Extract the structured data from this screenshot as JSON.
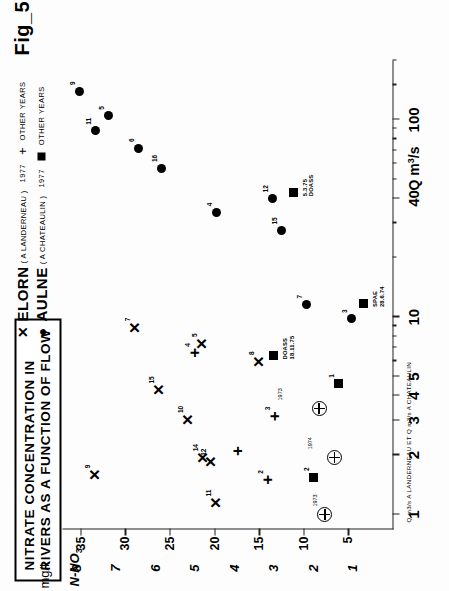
{
  "figure": {
    "number": "Fig_5",
    "title_line1": "NITRATE  CONCENTRATION  IN",
    "title_line2": "RIVERS  AS  A  FUNCTION  OF  FLOW"
  },
  "legend": {
    "entries": [
      {
        "marker": "x-marker",
        "name": "ELORN",
        "station": "( A  LANDERNEAU )",
        "year": "1977",
        "other_marker": "plus-marker",
        "other_label": "OTHER  YEARS"
      },
      {
        "marker": "dot-marker",
        "name": "AULNE",
        "station": "( A  CHATEAULIN )",
        "year": "1977",
        "other_marker": "square-marker",
        "other_label": "OTHER  YEARS"
      }
    ]
  },
  "axes": {
    "x": {
      "caption": "Q m",
      "caption_sup": "3",
      "caption_tail": "/s",
      "sub_caption": "Q m3/s  A  LANDERNEAU   ET   Q m3/s  A  CHATEAULIN",
      "scale": "log",
      "range": [
        0.85,
        200
      ],
      "ticks": [
        1,
        2,
        3,
        4,
        5,
        10,
        40,
        100
      ],
      "tick_labels": [
        "1",
        "2",
        "3",
        "4",
        "5",
        "10",
        "40",
        "100"
      ],
      "minor_ticks": [
        6,
        7,
        8,
        9,
        20,
        30,
        50,
        60,
        70,
        80,
        90,
        150,
        200
      ]
    },
    "y_primary": {
      "caption": "mg/l",
      "unit_label": "N-NO",
      "unit_sub": "3",
      "range": [
        0,
        37
      ],
      "ticks": [
        5,
        10,
        15,
        20,
        25,
        30,
        35
      ],
      "tick_labels": [
        "5",
        "10",
        "15",
        "20",
        "25",
        "30",
        "35"
      ]
    },
    "y_secondary": {
      "range": [
        0,
        8.35
      ],
      "ticks": [
        1,
        2,
        3,
        4,
        5,
        6,
        7,
        8
      ],
      "tick_labels": [
        "1",
        "2",
        "3",
        "4",
        "5",
        "6",
        "7",
        "8"
      ]
    }
  },
  "chart_data": {
    "type": "scatter",
    "title": "NITRATE CONCENTRATION IN RIVERS AS A FUNCTION OF FLOW",
    "xlabel": "Q m3/s",
    "ylabel": "N-NO3 mg/l",
    "xscale": "log",
    "xlim": [
      0.85,
      200
    ],
    "ylim": [
      0,
      37
    ],
    "grid": false,
    "legend_position": "top",
    "series": [
      {
        "name": "ELORN ( A LANDERNEAU ) 1977",
        "marker": "x",
        "points": [
          {
            "x": 1.15,
            "y": 19.8,
            "label": "11"
          },
          {
            "x": 1.95,
            "y": 21.3,
            "label": "14"
          },
          {
            "x": 1.85,
            "y": 20.4,
            "label": "12"
          },
          {
            "x": 3.05,
            "y": 23.0,
            "label": "10"
          },
          {
            "x": 4.3,
            "y": 26.2,
            "label": "15"
          },
          {
            "x": 6.0,
            "y": 15.0,
            "label": "8"
          },
          {
            "x": 7.4,
            "y": 21.4,
            "label": "5"
          },
          {
            "x": 8.9,
            "y": 28.9,
            "label": "7"
          },
          {
            "x": 1.6,
            "y": 33.4,
            "label": "9"
          }
        ]
      },
      {
        "name": "ELORN OTHER YEARS",
        "marker": "+",
        "points": [
          {
            "x": 1.5,
            "y": 14.0,
            "label": "2"
          },
          {
            "x": 2.1,
            "y": 17.4,
            "label": ""
          },
          {
            "x": 3.15,
            "y": 13.2,
            "label": "3"
          },
          {
            "x": 6.6,
            "y": 22.2,
            "label": "4"
          }
        ]
      },
      {
        "name": "ELORN other-years circled",
        "marker": "circled-plus",
        "points": [
          {
            "x": 1.0,
            "y": 7.6,
            "label": "1973"
          },
          {
            "x": 1.95,
            "y": 8.2,
            "label": "1974"
          },
          {
            "x": 3.45,
            "y": 11.6,
            "label": "1973"
          }
        ]
      },
      {
        "name": "AULNE ( A CHATEAULIN ) 1977",
        "marker": "o",
        "points": [
          {
            "x": 9.8,
            "y": 4.6,
            "label": "3"
          },
          {
            "x": 11.6,
            "y": 9.6,
            "label": "7"
          },
          {
            "x": 27.5,
            "y": 12.5,
            "label": "15"
          },
          {
            "x": 34.0,
            "y": 19.7,
            "label": "4"
          },
          {
            "x": 40.0,
            "y": 13.4,
            "label": "12"
          },
          {
            "x": 57.0,
            "y": 25.9,
            "label": "16"
          },
          {
            "x": 72.0,
            "y": 28.5,
            "label": "6"
          },
          {
            "x": 88.0,
            "y": 33.3,
            "label": "11"
          },
          {
            "x": 105.0,
            "y": 31.8,
            "label": "5"
          },
          {
            "x": 140.0,
            "y": 35.1,
            "label": "9"
          }
        ]
      },
      {
        "name": "AULNE OTHER YEARS",
        "marker": "s",
        "points": [
          {
            "x": 1.55,
            "y": 8.9,
            "label": "2",
            "note": ""
          },
          {
            "x": 4.6,
            "y": 6.1,
            "label": "1",
            "note": ""
          },
          {
            "x": 11.8,
            "y": 3.2,
            "label": "",
            "note": "SPAE\n28.6.74"
          },
          {
            "x": 6.4,
            "y": 13.3,
            "label": "",
            "note": "DOASS\n18.11.75"
          },
          {
            "x": 43.0,
            "y": 11.1,
            "label": "",
            "note": "5.3.75\nDOASS"
          }
        ]
      }
    ],
    "annotations": [
      {
        "text": "DOASS 18.11.75",
        "x": 6.4,
        "y": 13.3
      },
      {
        "text": "5.3.75 DOASS",
        "x": 43.0,
        "y": 11.1
      },
      {
        "text": "SPAE 28.6.74",
        "x": 11.8,
        "y": 3.2
      },
      {
        "text": "1973",
        "x": 1.0,
        "y": 7.6
      },
      {
        "text": "1974",
        "x": 1.95,
        "y": 8.2
      },
      {
        "text": "1973",
        "x": 3.45,
        "y": 11.6
      }
    ]
  }
}
